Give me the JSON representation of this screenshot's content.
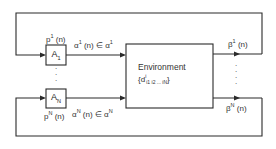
{
  "diagram": {
    "type": "block-diagram",
    "nodes": [
      {
        "id": "A1",
        "label": "A",
        "subscript": "1",
        "kind": "automaton"
      },
      {
        "id": "AN",
        "label": "A",
        "subscript": "N",
        "kind": "automaton"
      },
      {
        "id": "env",
        "label": "Environment",
        "content": "{d",
        "content_sup": "i",
        "content_sub": "i1 i2 ... iN",
        "content_close": "}",
        "kind": "environment"
      }
    ],
    "edges": [
      {
        "from": "A1",
        "to": "env",
        "label": "α",
        "label_sup": "1",
        "label_rest": " (n) ∈ α",
        "label_sup2": "1"
      },
      {
        "from": "AN",
        "to": "env",
        "label": "α",
        "label_sup": "N",
        "label_rest": " (n) ∈ α",
        "label_sup2": "N"
      },
      {
        "from": "env",
        "to": "A1",
        "label": "β",
        "label_sup": "1",
        "label_rest": " (n)",
        "via": "top feedback loop"
      },
      {
        "from": "env",
        "to": "AN",
        "label": "β",
        "label_sup": "N",
        "label_rest": " (n)",
        "via": "bottom feedback loop"
      }
    ],
    "annotations": {
      "p1": {
        "base": "p",
        "sup": "1",
        "rest": " (n)"
      },
      "pN": {
        "base": "p",
        "sup": "N",
        "rest": " (n)"
      },
      "vertical_dots": "⋮"
    }
  },
  "colors": {
    "line": "#2a2a2a",
    "background": "#ffffff"
  }
}
